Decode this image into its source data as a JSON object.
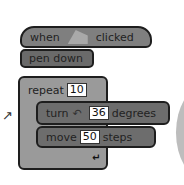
{
  "blocks": {
    "hat": {
      "prefix": "when",
      "icon": "green-flag-icon",
      "suffix": "clicked"
    },
    "pen": {
      "label": "pen down"
    },
    "repeat": {
      "label": "repeat",
      "value": "10",
      "loop_icon": "↵"
    },
    "turn": {
      "label": "turn",
      "icon": "↶",
      "value": "36",
      "suffix": "degrees"
    },
    "move": {
      "label": "move",
      "value": "50",
      "suffix": "steps"
    }
  },
  "decorations": {
    "drag_arrow": "↗"
  }
}
